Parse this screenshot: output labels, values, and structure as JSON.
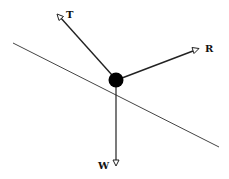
{
  "diagram": {
    "type": "free-body diagram",
    "forces": [
      {
        "id": "T",
        "label": "T",
        "direction": "up-left"
      },
      {
        "id": "R",
        "label": "R",
        "direction": "up-right"
      },
      {
        "id": "W",
        "label": "W",
        "direction": "down"
      }
    ],
    "body": "point mass (black circle)",
    "surface": "inclined line"
  },
  "colors": {
    "line": "#222222",
    "incline": "#444444",
    "mass": "#000000",
    "background": "#ffffff"
  }
}
